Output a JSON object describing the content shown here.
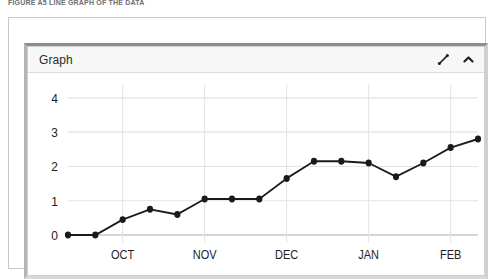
{
  "caption": "FIGURE A5 LINE GRAPH OF THE DATA",
  "panel": {
    "title": "Graph",
    "actions": [
      {
        "name": "expand-icon",
        "label": "Expand"
      },
      {
        "name": "collapse-icon",
        "label": "Collapse"
      }
    ]
  },
  "colors": {
    "line": "#1a1a1a",
    "marker": "#1a1a1a",
    "grid": "#e3e3e3",
    "axis": "#b9b9b9",
    "tick_label": "#1d1d1d",
    "header_bg": "#f7f7f7",
    "panel_border": "#d0d0d0"
  },
  "chart_data": {
    "type": "line",
    "title": "Graph",
    "xlabel": "",
    "ylabel": "",
    "ylim": [
      0,
      4.4
    ],
    "yticks": [
      "0",
      "1",
      "2",
      "3",
      "4"
    ],
    "ytick_values": [
      0,
      1,
      2,
      3,
      4
    ],
    "xticks": [
      "OCT",
      "NOV",
      "DEC",
      "JAN",
      "FEB"
    ],
    "xtick_positions": [
      2,
      5,
      8,
      11,
      14
    ],
    "grid": true,
    "legend": "none",
    "markers": true,
    "x": [
      0,
      1,
      2,
      3,
      4,
      5,
      6,
      7,
      8,
      9,
      10,
      11,
      12,
      13,
      14,
      15
    ],
    "values": [
      0,
      0,
      0.45,
      0.75,
      0.6,
      1.05,
      1.05,
      1.05,
      1.65,
      2.15,
      2.15,
      2.1,
      1.7,
      2.1,
      2.55,
      2.8
    ]
  }
}
